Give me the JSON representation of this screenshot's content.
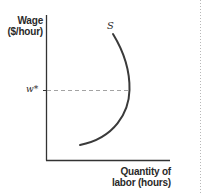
{
  "diagram": {
    "type": "labor-supply-curve",
    "y_axis": {
      "label_line1": "Wage",
      "label_line2": "($/hour)"
    },
    "x_axis": {
      "label_line1": "Quantity of",
      "label_line2": "labor (hours)"
    },
    "curve": {
      "label": "S",
      "shape": "backward-bending supply curve"
    },
    "markers": {
      "wage_star": "w*"
    },
    "colors": {
      "axis": "#333333",
      "curve": "#3a3a3a",
      "dashed": "#999999",
      "text": "#2a2a2a",
      "dotted_border": "#b0b0b0"
    }
  }
}
